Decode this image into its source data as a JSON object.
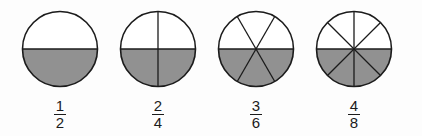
{
  "figure": {
    "background_color": "#fdfdfd",
    "shade_color": "#919191",
    "unshaded_color": "#ffffff",
    "outline_color": "#1b1b1b",
    "text_color": "#1b1b1b"
  },
  "items": [
    {
      "name": "one-half",
      "numerator": "1",
      "denominator": "2",
      "fraction_text": "1/2",
      "total_sectors": 2,
      "shaded_sectors": 1,
      "divider_count": 1
    },
    {
      "name": "two-fourths",
      "numerator": "2",
      "denominator": "4",
      "fraction_text": "2/4",
      "total_sectors": 4,
      "shaded_sectors": 2,
      "divider_count": 2
    },
    {
      "name": "three-sixths",
      "numerator": "3",
      "denominator": "6",
      "fraction_text": "3/6",
      "total_sectors": 6,
      "shaded_sectors": 3,
      "divider_count": 3
    },
    {
      "name": "four-eighths",
      "numerator": "4",
      "denominator": "8",
      "fraction_text": "4/8",
      "total_sectors": 8,
      "shaded_sectors": 4,
      "divider_count": 4
    }
  ],
  "chart_data": {
    "type": "pie",
    "categories": [
      "1/2",
      "2/4",
      "3/6",
      "4/8"
    ],
    "values": [
      0.5,
      0.5,
      0.5,
      0.5
    ],
    "series": [
      {
        "name": "shaded sectors",
        "values": [
          1,
          2,
          3,
          4
        ]
      },
      {
        "name": "total sectors",
        "values": [
          2,
          4,
          6,
          8
        ]
      }
    ],
    "xlabel": "",
    "ylabel": "",
    "legend": "none",
    "grid": false
  }
}
